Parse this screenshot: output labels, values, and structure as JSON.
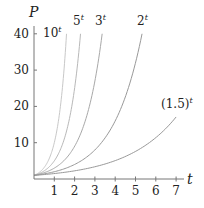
{
  "chart_data": {
    "type": "line",
    "title": "",
    "xlabel": "t",
    "ylabel": "P",
    "xlim": [
      0,
      7.5
    ],
    "ylim": [
      0,
      42
    ],
    "xticks": [
      1,
      2,
      3,
      4,
      5,
      6,
      7
    ],
    "yticks": [
      10,
      20,
      30,
      40
    ],
    "grid": false,
    "legend": "inline labels at curve ends",
    "series": [
      {
        "name": "10^t",
        "base": 10,
        "label_main": "10",
        "label_sup": "t",
        "t_range": [
          0,
          1.602
        ],
        "color": "#c8c8c8"
      },
      {
        "name": "5^t",
        "base": 5,
        "label_main": "5",
        "label_sup": "t",
        "t_range": [
          0,
          2.292
        ],
        "color": "#b8b8b8"
      },
      {
        "name": "3^t",
        "base": 3,
        "label_main": "3",
        "label_sup": "t",
        "t_range": [
          0,
          3.358
        ],
        "color": "#a8a8a8"
      },
      {
        "name": "2^t",
        "base": 2,
        "label_main": "2",
        "label_sup": "t",
        "t_range": [
          0,
          5.322
        ],
        "color": "#999999"
      },
      {
        "name": "(1.5)^t",
        "base": 1.5,
        "label_main": "(1.5)",
        "label_sup": "t",
        "t_range": [
          0,
          7.0
        ],
        "color": "#999999"
      }
    ],
    "sample_points": {
      "10^t": [
        [
          0,
          1
        ],
        [
          0.5,
          3.16
        ],
        [
          1,
          10
        ],
        [
          1.3,
          19.95
        ],
        [
          1.602,
          40
        ]
      ],
      "5^t": [
        [
          0,
          1
        ],
        [
          1,
          5
        ],
        [
          1.5,
          11.18
        ],
        [
          2,
          25
        ],
        [
          2.292,
          40
        ]
      ],
      "3^t": [
        [
          0,
          1
        ],
        [
          1,
          3
        ],
        [
          2,
          9
        ],
        [
          3,
          27
        ],
        [
          3.358,
          40
        ]
      ],
      "2^t": [
        [
          0,
          1
        ],
        [
          1,
          2
        ],
        [
          2,
          4
        ],
        [
          3,
          8
        ],
        [
          4,
          16
        ],
        [
          5,
          32
        ],
        [
          5.322,
          40
        ]
      ],
      "(1.5)^t": [
        [
          0,
          1
        ],
        [
          1,
          1.5
        ],
        [
          2,
          2.25
        ],
        [
          3,
          3.375
        ],
        [
          4,
          5.06
        ],
        [
          5,
          7.59
        ],
        [
          6,
          11.39
        ],
        [
          7,
          17.09
        ]
      ]
    }
  },
  "axes": {
    "x_title": "t",
    "y_title": "P",
    "x_tick_labels": [
      "1",
      "2",
      "3",
      "4",
      "5",
      "6",
      "7"
    ],
    "y_tick_labels": [
      "10",
      "20",
      "30",
      "40"
    ]
  },
  "labels": {
    "l10": {
      "main": "10",
      "sup": "t"
    },
    "l5": {
      "main": "5",
      "sup": "t"
    },
    "l3": {
      "main": "3",
      "sup": "t"
    },
    "l2": {
      "main": "2",
      "sup": "t"
    },
    "l15": {
      "main": "(1.5)",
      "sup": "t"
    }
  },
  "colors": {
    "axis": "#777777",
    "text": "#222222"
  }
}
